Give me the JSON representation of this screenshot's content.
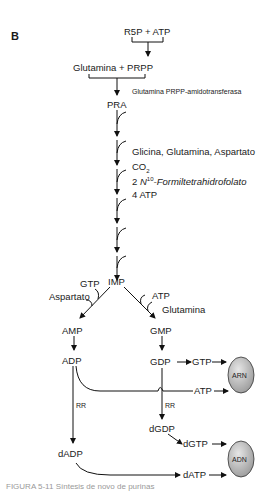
{
  "panel_label": "B",
  "nodes": {
    "r5p_atp": "R5P + ATP",
    "glutamina_prpp": "Glutamina  +  PRPP",
    "enzyme": "Glutamina PRPP-amidotransferasa",
    "pra": "PRA",
    "imp": "IMP",
    "amp": "AMP",
    "adp": "ADP",
    "dadp": "dADP",
    "gmp": "GMP",
    "gdp": "GDP",
    "gtp": "GTP",
    "atp": "ATP",
    "dgdp": "dGDP",
    "dgtp": "dGTP",
    "datp": "dATP",
    "arn": "ARN",
    "adn": "ADN"
  },
  "cofactors": {
    "line1": "Glicina, Glutamina, Aspartato",
    "co2": "CO",
    "co2_sub": "2",
    "formyl_prefix": "2 ",
    "formyl_n": "N",
    "formyl_sup": "10",
    "formyl_rest": "-Formiltetrahidrofolato",
    "atp4": "4 ATP",
    "amp_branch_gtp": "GTP",
    "amp_branch_asp": "Aspartato",
    "gmp_branch_atp": "ATP",
    "gmp_branch_gln": "Glutamina",
    "rr_left": "RR",
    "rr_right": "RR"
  },
  "caption": "FIGURA 5-11 Síntesis de novo de purinas"
}
